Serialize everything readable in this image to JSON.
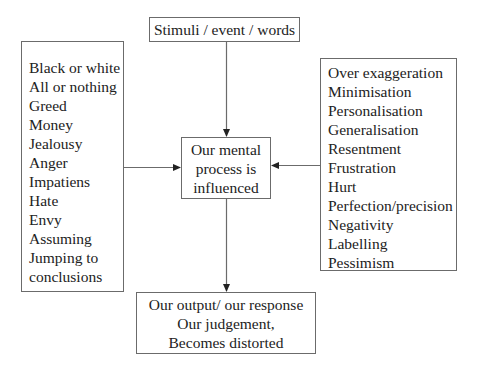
{
  "diagram": {
    "top_box": {
      "label": "Stimuli / event / words"
    },
    "left_box": {
      "items": [
        "Black or white",
        "All or nothing",
        "Greed",
        "Money",
        "Jealousy",
        "Anger",
        "Impatiens",
        "Hate",
        "Envy",
        "Assuming",
        "Jumping to",
        "conclusions"
      ]
    },
    "center_box": {
      "lines": [
        "Our mental",
        "process is",
        "influenced"
      ]
    },
    "right_box": {
      "items": [
        "Over exaggeration",
        "Minimisation",
        "Personalisation",
        "Generalisation",
        "Resentment",
        "Frustration",
        "Hurt",
        "Perfection/precision",
        "Negativity",
        "Labelling",
        "Pessimism"
      ]
    },
    "bottom_box": {
      "lines": [
        "Our output/ our response",
        "Our judgement,",
        "Becomes distorted"
      ]
    },
    "arrows": [
      {
        "from": "top_box",
        "to": "center_box"
      },
      {
        "from": "left_box",
        "to": "center_box"
      },
      {
        "from": "right_box",
        "to": "center_box"
      },
      {
        "from": "center_box",
        "to": "bottom_box"
      }
    ],
    "colors": {
      "stroke": "#6b6b6b",
      "text": "#222222",
      "background": "#ffffff"
    }
  }
}
